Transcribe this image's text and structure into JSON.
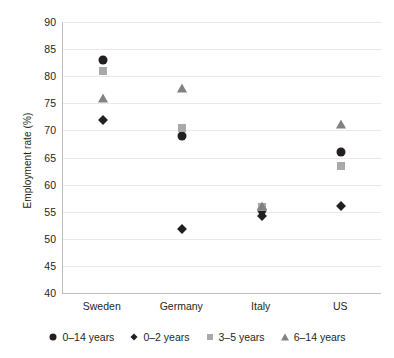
{
  "chart_data": {
    "type": "scatter",
    "title": "",
    "xlabel": "",
    "ylabel": "Employment rate (%)",
    "categories": [
      "Sweden",
      "Germany",
      "Italy",
      "US"
    ],
    "ylim": [
      40,
      90
    ],
    "ytick_step": 5,
    "yticks": [
      90,
      85,
      80,
      75,
      70,
      65,
      60,
      55,
      50,
      45,
      40
    ],
    "ytick_labels": [
      "90",
      "85",
      "80",
      "75",
      "70",
      "65",
      "60",
      "55",
      "50",
      "45",
      "40"
    ],
    "grid": true,
    "legend_position": "bottom",
    "series": [
      {
        "name": "0–14 years",
        "marker": "circle",
        "color": "#231f20",
        "values": [
          83.0,
          69.0,
          55.3,
          66.0
        ]
      },
      {
        "name": "0–2 years",
        "marker": "diamond",
        "color": "#231f20",
        "values": [
          72.0,
          51.8,
          54.2,
          56.0
        ]
      },
      {
        "name": "3–5 years",
        "marker": "square",
        "color": "#a7a9ac",
        "values": [
          81.0,
          70.5,
          55.8,
          63.5
        ]
      },
      {
        "name": "6–14 years",
        "marker": "triangle",
        "color": "#808285",
        "values": [
          76.0,
          77.8,
          56.0,
          71.2
        ]
      }
    ]
  },
  "colors": {
    "axis": "#bcbec0",
    "grid": "#e8e9ea",
    "text": "#231f20",
    "dark_marker": "#231f20",
    "light_marker": "#a7a9ac",
    "mid_marker": "#808285",
    "background": "#ffffff"
  }
}
